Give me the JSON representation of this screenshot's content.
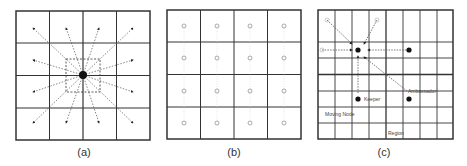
{
  "figure": {
    "panels": [
      {
        "id": "a",
        "caption": "(a)",
        "grid": "4x4",
        "description": "Central node broadcasting dashed arrows outward to all cells; dashed box around center"
      },
      {
        "id": "b",
        "caption": "(b)",
        "grid": "4x4",
        "description": "Small circle nodes in each cell"
      },
      {
        "id": "c",
        "caption": "(c)",
        "grid": "8x8",
        "description": "Keeper and ambassador nodes with dashed arrows"
      }
    ],
    "labels": {
      "keeper": "Keeper",
      "ambassador": "Ambassador",
      "moving_node": "Moving Node",
      "region": "Region"
    }
  }
}
